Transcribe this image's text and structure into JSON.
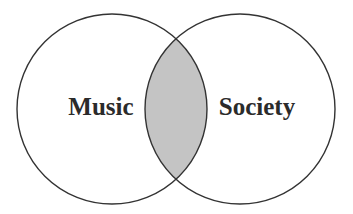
{
  "diagram": {
    "type": "venn",
    "sets": [
      {
        "label": "Music",
        "cx": 112,
        "cy": 109,
        "r": 95
      },
      {
        "label": "Society",
        "cx": 240,
        "cy": 109,
        "r": 95
      }
    ],
    "intersection": {
      "label": "",
      "shaded": true
    },
    "colors": {
      "stroke": "#333333",
      "intersection_fill": "#c4c4c4",
      "background": "#ffffff",
      "text": "#2b2b2b"
    }
  }
}
